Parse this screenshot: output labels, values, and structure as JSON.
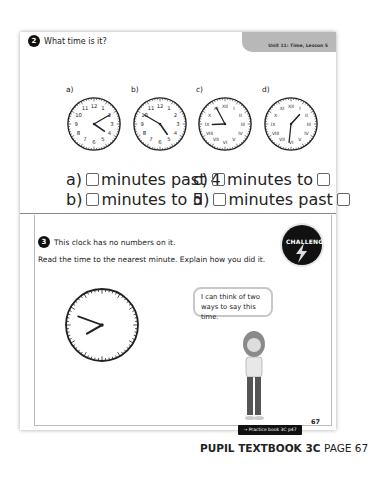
{
  "header": {
    "unit_label": "Unit 11: Time, Lesson 5"
  },
  "question2": {
    "number": "2",
    "prompt": "What time is it?",
    "clocks": [
      {
        "label": "a)",
        "numerals": "arabic",
        "hour_deg": 125,
        "minute_deg": 60
      },
      {
        "label": "b)",
        "numerals": "arabic",
        "hour_deg": 145,
        "minute_deg": 300
      },
      {
        "label": "c)",
        "numerals": "roman",
        "hour_deg": 268,
        "minute_deg": 332
      },
      {
        "label": "d)",
        "numerals": "roman",
        "hour_deg": 42,
        "minute_deg": 186
      }
    ],
    "answers": [
      {
        "label": "a)",
        "text": "minutes past 4",
        "trailing_box": false
      },
      {
        "label": "b)",
        "text": "minutes to 5",
        "trailing_box": false
      },
      {
        "label": "c)",
        "text": "minutes to",
        "trailing_box": true
      },
      {
        "label": "d)",
        "text": "minutes past",
        "trailing_box": true
      }
    ]
  },
  "question3": {
    "number": "3",
    "line1": "This clock has no numbers on it.",
    "line2": "Read the time to the nearest minute. Explain how you did it.",
    "badge": "CHALLENGE",
    "speech": "I can think of two ways to say this time.",
    "clock": {
      "hour_deg": 240,
      "minute_deg": 290
    }
  },
  "footer": {
    "practice_link": "→ Practice book 3C p47",
    "page_number": "67",
    "book_title": "PUPIL TEXTBOOK 3C",
    "page_label": "PAGE 67"
  }
}
